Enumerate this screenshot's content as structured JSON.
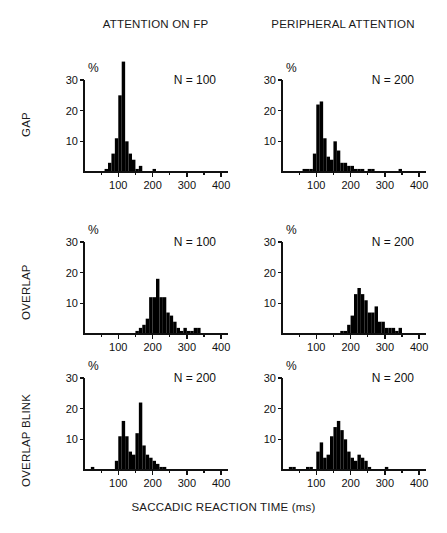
{
  "figure": {
    "xaxis_title": "SACCADIC REACTION TIME (ms)",
    "column_headers": [
      "ATTENTION ON FP",
      "PERIPHERAL ATTENTION"
    ],
    "row_labels": [
      "GAP",
      "OVERLAP",
      "OVERLAP BLINK"
    ],
    "y_unit": "%",
    "ink_color": "#000000"
  },
  "chart_data": [
    {
      "type": "bar",
      "title": "GAP / ATTENTION ON FP",
      "panel_id": "gap-attention-on-fp",
      "row": "GAP",
      "column": "ATTENTION ON FP",
      "annotation": "N = 100",
      "n": 100,
      "xlabel": "SACCADIC REACTION TIME (ms)",
      "ylabel": "%",
      "xlim": [
        0,
        420
      ],
      "ylim": [
        0,
        30
      ],
      "xticks": [
        100,
        200,
        300,
        400
      ],
      "xticklabels": [
        "100",
        "200",
        "300",
        "400"
      ],
      "xminorticks": [
        50,
        150,
        250,
        350
      ],
      "yticks": [
        10,
        20,
        30
      ],
      "yticklabels": [
        "10",
        "20",
        "30"
      ],
      "grid": false,
      "bin_width": 10,
      "bin_starts": [
        60,
        70,
        80,
        90,
        100,
        110,
        120,
        130,
        140,
        150,
        160,
        190,
        200
      ],
      "values": [
        1,
        3,
        6,
        11,
        25,
        36,
        10,
        6,
        4,
        1,
        2,
        0,
        1
      ]
    },
    {
      "type": "bar",
      "title": "GAP / PERIPHERAL ATTENTION",
      "panel_id": "gap-peripheral-attention",
      "row": "GAP",
      "column": "PERIPHERAL ATTENTION",
      "annotation": "N = 200",
      "n": 200,
      "xlabel": "SACCADIC REACTION TIME (ms)",
      "ylabel": "%",
      "xlim": [
        0,
        420
      ],
      "ylim": [
        0,
        30
      ],
      "xticks": [
        100,
        200,
        300,
        400
      ],
      "xticklabels": [
        "100",
        "200",
        "300",
        "400"
      ],
      "xminorticks": [
        50,
        150,
        250,
        350
      ],
      "yticks": [
        10,
        20,
        30
      ],
      "yticklabels": [
        "10",
        "20",
        "30"
      ],
      "grid": false,
      "bin_width": 10,
      "bin_starts": [
        60,
        70,
        80,
        90,
        100,
        110,
        120,
        130,
        140,
        150,
        160,
        170,
        180,
        190,
        200,
        210,
        220,
        230,
        250,
        260,
        340
      ],
      "values": [
        1,
        1,
        1,
        6,
        22,
        23,
        11,
        5,
        4,
        10,
        7,
        3,
        3,
        2,
        2,
        1,
        1,
        1,
        1,
        1,
        1
      ]
    },
    {
      "type": "bar",
      "title": "OVERLAP / ATTENTION ON FP",
      "panel_id": "overlap-attention-on-fp",
      "row": "OVERLAP",
      "column": "ATTENTION ON FP",
      "annotation": "N = 100",
      "n": 100,
      "xlabel": "SACCADIC REACTION TIME (ms)",
      "ylabel": "%",
      "xlim": [
        0,
        420
      ],
      "ylim": [
        0,
        30
      ],
      "xticks": [
        100,
        200,
        300,
        400
      ],
      "xticklabels": [
        "100",
        "200",
        "300",
        "400"
      ],
      "xminorticks": [
        50,
        150,
        250,
        350
      ],
      "yticks": [
        10,
        20,
        30
      ],
      "yticklabels": [
        "10",
        "20",
        "30"
      ],
      "grid": false,
      "bin_width": 10,
      "bin_starts": [
        150,
        160,
        170,
        180,
        190,
        200,
        210,
        220,
        230,
        240,
        250,
        260,
        270,
        280,
        290,
        300,
        310,
        320,
        330
      ],
      "values": [
        1,
        2,
        3,
        5,
        12,
        12,
        18,
        12,
        12,
        7,
        6,
        4,
        2,
        1,
        2,
        1,
        1,
        2,
        2
      ]
    },
    {
      "type": "bar",
      "title": "OVERLAP / PERIPHERAL ATTENTION",
      "panel_id": "overlap-peripheral-attention",
      "row": "OVERLAP",
      "column": "PERIPHERAL ATTENTION",
      "annotation": "N = 200",
      "n": 200,
      "xlabel": "SACCADIC REACTION TIME (ms)",
      "ylabel": "%",
      "xlim": [
        0,
        420
      ],
      "ylim": [
        0,
        30
      ],
      "xticks": [
        100,
        200,
        300,
        400
      ],
      "xticklabels": [
        "100",
        "200",
        "300",
        "400"
      ],
      "xminorticks": [
        50,
        150,
        250,
        350
      ],
      "yticks": [
        10,
        20,
        30
      ],
      "yticklabels": [
        "10",
        "20",
        "30"
      ],
      "grid": false,
      "bin_width": 10,
      "bin_starts": [
        170,
        180,
        190,
        200,
        210,
        220,
        230,
        240,
        250,
        260,
        270,
        280,
        290,
        300,
        310,
        320,
        330,
        340
      ],
      "values": [
        1,
        1,
        3,
        6,
        13,
        15,
        13,
        11,
        7,
        7,
        9,
        4,
        4,
        2,
        2,
        2,
        1,
        2
      ]
    },
    {
      "type": "bar",
      "title": "OVERLAP BLINK / ATTENTION ON FP",
      "panel_id": "overlap-blink-attention-on-fp",
      "row": "OVERLAP BLINK",
      "column": "ATTENTION ON FP",
      "annotation": "N = 200",
      "n": 200,
      "xlabel": "SACCADIC REACTION TIME (ms)",
      "ylabel": "%",
      "xlim": [
        0,
        420
      ],
      "ylim": [
        0,
        30
      ],
      "xticks": [
        100,
        200,
        300,
        400
      ],
      "xticklabels": [
        "100",
        "200",
        "300",
        "400"
      ],
      "xminorticks": [
        50,
        150,
        250,
        350
      ],
      "yticks": [
        10,
        20,
        30
      ],
      "yticklabels": [
        "10",
        "20",
        "30"
      ],
      "grid": false,
      "bin_width": 10,
      "bin_starts": [
        20,
        90,
        100,
        110,
        120,
        130,
        140,
        150,
        160,
        170,
        180,
        190,
        200,
        210,
        220,
        230
      ],
      "values": [
        1,
        3,
        11,
        16,
        11,
        6,
        5,
        12,
        22,
        8,
        5,
        4,
        3,
        2,
        1,
        1
      ]
    },
    {
      "type": "bar",
      "title": "OVERLAP BLINK / PERIPHERAL ATTENTION",
      "panel_id": "overlap-blink-peripheral-attention",
      "row": "OVERLAP BLINK",
      "column": "PERIPHERAL ATTENTION",
      "annotation": "N = 200",
      "n": 200,
      "xlabel": "SACCADIC REACTION TIME (ms)",
      "ylabel": "%",
      "xlim": [
        0,
        420
      ],
      "ylim": [
        0,
        30
      ],
      "xticks": [
        100,
        200,
        300,
        400
      ],
      "xticklabels": [
        "100",
        "200",
        "300",
        "400"
      ],
      "xminorticks": [
        50,
        150,
        250,
        350
      ],
      "yticks": [
        10,
        20,
        30
      ],
      "yticklabels": [
        "10",
        "20",
        "30"
      ],
      "grid": false,
      "bin_width": 10,
      "bin_starts": [
        20,
        30,
        70,
        80,
        100,
        110,
        120,
        130,
        140,
        150,
        160,
        170,
        180,
        190,
        200,
        210,
        220,
        230,
        240,
        250,
        300
      ],
      "values": [
        1,
        1,
        1,
        1,
        6,
        9,
        4,
        5,
        11,
        14,
        16,
        13,
        10,
        6,
        4,
        3,
        5,
        4,
        3,
        1,
        1
      ]
    }
  ]
}
